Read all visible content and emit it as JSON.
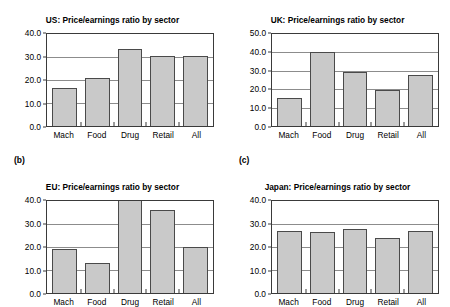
{
  "figure": {
    "panel_labels": [
      "",
      "(b)",
      "",
      "(c)"
    ]
  },
  "chart_data": [
    {
      "type": "bar",
      "title": "US: Price/earnings ratio by sector",
      "panel_label": "",
      "categories": [
        "Mach",
        "Food",
        "Drug",
        "Retail",
        "All"
      ],
      "values": [
        16.5,
        21.0,
        33.5,
        30.5,
        30.5
      ],
      "ylim": [
        0.0,
        40.0
      ],
      "yticks": [
        0.0,
        10.0,
        20.0,
        30.0,
        40.0
      ],
      "ytick_labels": [
        "0.0",
        "10.0",
        "20.0",
        "30.0",
        "40.0"
      ],
      "xlabel": "",
      "ylabel": "",
      "grid": true,
      "legend": "none",
      "bar_color": "#c9c9c9",
      "bar_edge_color": "#4a4a4a"
    },
    {
      "type": "bar",
      "title": "UK: Price/earnings ratio by sector",
      "panel_label": "",
      "categories": [
        "Mach",
        "Food",
        "Drug",
        "Retail",
        "All"
      ],
      "values": [
        15.0,
        40.0,
        29.5,
        19.5,
        27.5
      ],
      "ylim": [
        0.0,
        50.0
      ],
      "yticks": [
        0.0,
        10.0,
        20.0,
        30.0,
        40.0,
        50.0
      ],
      "ytick_labels": [
        "0.0",
        "10.0",
        "20.0",
        "30.0",
        "40.0",
        "50.0"
      ],
      "xlabel": "",
      "ylabel": "",
      "grid": true,
      "legend": "none",
      "bar_color": "#c9c9c9",
      "bar_edge_color": "#4a4a4a"
    },
    {
      "type": "bar",
      "title": "EU: Price/earnings ratio by sector",
      "panel_label": "(b)",
      "categories": [
        "Mach",
        "Food",
        "Drug",
        "Retail",
        "All"
      ],
      "values": [
        19.0,
        13.0,
        42.0,
        36.0,
        20.0
      ],
      "ylim": [
        0.0,
        40.0
      ],
      "yticks": [
        0.0,
        10.0,
        20.0,
        30.0,
        40.0
      ],
      "ytick_labels": [
        "0.0",
        "10.0",
        "20.0",
        "30.0",
        "40.0"
      ],
      "xlabel": "",
      "ylabel": "",
      "grid": true,
      "legend": "none",
      "note": "Drug bar exceeds the 40.0 axis maximum and is clipped at the top of the plot area",
      "bar_color": "#c9c9c9",
      "bar_edge_color": "#4a4a4a"
    },
    {
      "type": "bar",
      "title": "Japan: Price/earnings ratio by sector",
      "panel_label": "(c)",
      "categories": [
        "Mach",
        "Food",
        "Drug",
        "Retail",
        "All"
      ],
      "values": [
        27.0,
        26.5,
        28.0,
        24.0,
        27.0
      ],
      "ylim": [
        0.0,
        40.0
      ],
      "yticks": [
        0.0,
        10.0,
        20.0,
        30.0,
        40.0
      ],
      "ytick_labels": [
        "0.0",
        "10.0",
        "20.0",
        "30.0",
        "40.0"
      ],
      "xlabel": "",
      "ylabel": "",
      "grid": true,
      "legend": "none",
      "bar_color": "#c9c9c9",
      "bar_edge_color": "#4a4a4a"
    }
  ]
}
